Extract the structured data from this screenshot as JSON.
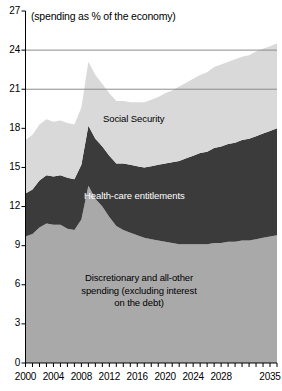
{
  "subtitle": "(spending as % of the economy)",
  "colors": {
    "discretionary": "#a9a9a9",
    "health": "#3b3b3b",
    "social_security": "#d9d9d9",
    "axis": "#000000",
    "gridline": "#8c8c8c",
    "background": "#ffffff"
  },
  "labels": {
    "social_security": "Social Security",
    "health": "Health-care entitlements",
    "discretionary_line1": "Discretionary and all-other",
    "discretionary_line2": "spending (excluding interest",
    "discretionary_line3": "on the debt)"
  },
  "axes": {
    "y_ticks": [
      "0",
      "3",
      "6",
      "9",
      "12",
      "15",
      "18",
      "21",
      "24",
      "27"
    ],
    "x_ticks": [
      "2000",
      "2004",
      "2008",
      "2012",
      "2016",
      "2020",
      "2024",
      "2028",
      "2035"
    ]
  },
  "chart_data": {
    "type": "area",
    "stacked": true,
    "title": "",
    "subtitle": "(spending as % of the economy)",
    "xlabel": "",
    "ylabel": "",
    "ylim": [
      0,
      27
    ],
    "xlim": [
      2000,
      2036
    ],
    "ytick_step": 3,
    "gridlines_at": [
      21,
      24
    ],
    "grid": true,
    "legend_position": "inline-labels",
    "x": [
      2000,
      2001,
      2002,
      2003,
      2004,
      2005,
      2006,
      2007,
      2008,
      2009,
      2010,
      2011,
      2012,
      2013,
      2014,
      2015,
      2016,
      2017,
      2018,
      2019,
      2020,
      2021,
      2022,
      2023,
      2024,
      2025,
      2026,
      2027,
      2028,
      2029,
      2030,
      2031,
      2032,
      2033,
      2034,
      2035,
      2036
    ],
    "series": [
      {
        "name": "Discretionary and all-other spending (excluding interest on the debt)",
        "color": "#a9a9a9",
        "values": [
          9.7,
          9.9,
          10.4,
          10.7,
          10.6,
          10.6,
          10.3,
          10.2,
          11.0,
          13.6,
          12.6,
          12.0,
          11.2,
          10.5,
          10.2,
          10.0,
          9.8,
          9.6,
          9.5,
          9.4,
          9.3,
          9.2,
          9.1,
          9.1,
          9.1,
          9.1,
          9.1,
          9.2,
          9.2,
          9.3,
          9.3,
          9.4,
          9.4,
          9.5,
          9.6,
          9.7,
          9.8
        ]
      },
      {
        "name": "Health-care entitlements",
        "color": "#3b3b3b",
        "values": [
          3.3,
          3.4,
          3.6,
          3.7,
          3.7,
          3.8,
          3.9,
          3.9,
          4.2,
          4.6,
          4.6,
          4.6,
          4.7,
          4.8,
          5.1,
          5.2,
          5.3,
          5.4,
          5.6,
          5.8,
          6.0,
          6.2,
          6.4,
          6.6,
          6.8,
          7.0,
          7.1,
          7.3,
          7.4,
          7.5,
          7.6,
          7.7,
          7.8,
          7.9,
          8.0,
          8.1,
          8.2
        ]
      },
      {
        "name": "Social Security",
        "color": "#d9d9d9",
        "values": [
          4.1,
          4.2,
          4.3,
          4.3,
          4.2,
          4.2,
          4.2,
          4.2,
          4.4,
          4.9,
          4.9,
          4.8,
          4.8,
          4.8,
          4.8,
          4.8,
          4.9,
          5.0,
          5.1,
          5.2,
          5.4,
          5.5,
          5.7,
          5.8,
          5.9,
          6.0,
          6.1,
          6.2,
          6.3,
          6.3,
          6.4,
          6.4,
          6.4,
          6.5,
          6.5,
          6.5,
          6.5
        ]
      }
    ],
    "totals": [
      17.1,
      17.5,
      18.3,
      18.7,
      18.5,
      18.6,
      18.4,
      18.3,
      19.6,
      23.1,
      22.1,
      21.4,
      20.7,
      20.1,
      20.1,
      20.0,
      20.0,
      20.0,
      20.2,
      20.4,
      20.7,
      20.9,
      21.2,
      21.5,
      21.8,
      22.1,
      22.3,
      22.7,
      22.9,
      23.1,
      23.3,
      23.5,
      23.6,
      23.9,
      24.1,
      24.3,
      24.5
    ]
  }
}
